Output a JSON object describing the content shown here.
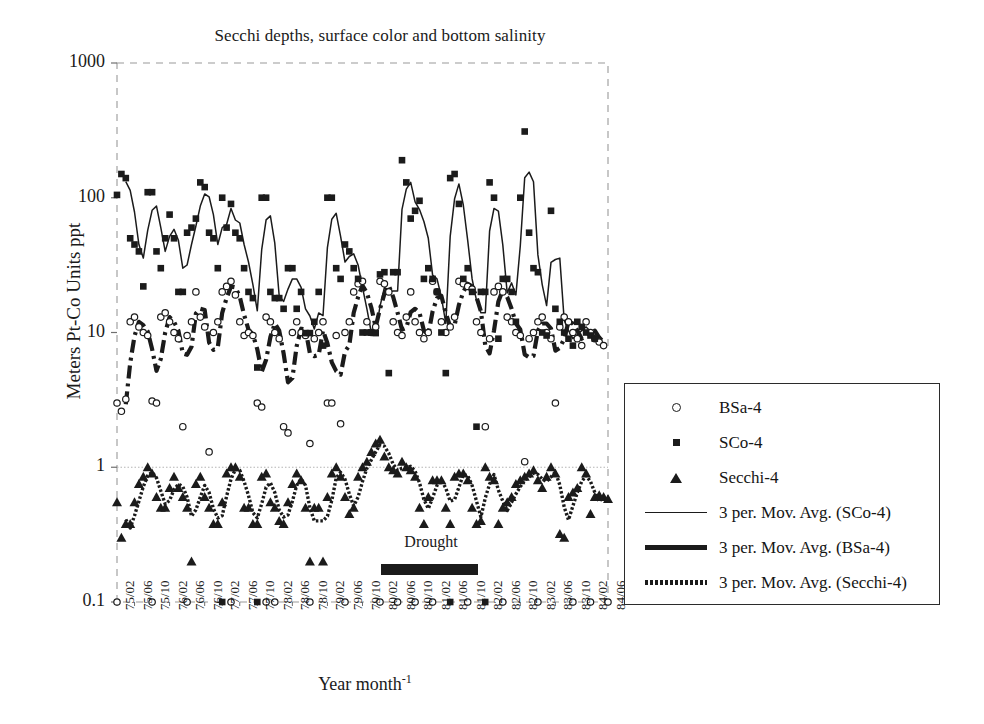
{
  "chart_data": {
    "type": "line",
    "title": "Secchi depths, surface color and bottom salinity",
    "xlabel": "Year month",
    "xlabel_exponent": "-1",
    "ylabel": "Meters Pt-Co Units ppt",
    "y_scale": "log",
    "ylim": [
      0.1,
      1000
    ],
    "ytick_labels": [
      "1000",
      "100",
      "10",
      "1",
      "0.1"
    ],
    "ytick_values": [
      1000,
      100,
      10,
      1,
      0.1
    ],
    "grid": "dashed-border-plus-dotted-line-at-1",
    "legend_position": "right-outside",
    "x_tick_labels": [
      "75/02",
      "75/06",
      "75/10",
      "76/02",
      "76/06",
      "76/10",
      "77/02",
      "77/06",
      "77/10",
      "78/02",
      "78/06",
      "78/10",
      "79/02",
      "79/06",
      "79/10",
      "80/02",
      "80/06",
      "80/10",
      "81/02",
      "81/06",
      "81/10",
      "82/02",
      "82/06",
      "82/10",
      "83/02",
      "83/06",
      "83/10",
      "84/02",
      "84/06"
    ],
    "x_tick_step_months": 4,
    "x_start": "75/02",
    "x_end": "84/06",
    "n_points": 113,
    "annotations": [
      {
        "text": "Drought",
        "type": "label-with-bar",
        "start": "80/10",
        "end": "81/10"
      }
    ],
    "series": [
      {
        "name": "BSa-4",
        "marker": "open-circle",
        "values": [
          3.0,
          2.6,
          3.2,
          12,
          13,
          11,
          10,
          9.5,
          3.1,
          3.0,
          13,
          14,
          12,
          10,
          9.0,
          2.0,
          9.5,
          12,
          20,
          13,
          11,
          1.3,
          10,
          12,
          20,
          22,
          24,
          19,
          12,
          9.5,
          10,
          9.5,
          3.0,
          2.8,
          13,
          12,
          10,
          9.0,
          2.0,
          1.8,
          10,
          12,
          10,
          9.5,
          1.5,
          9.0,
          10,
          12,
          3.0,
          3.0,
          9.5,
          2.1,
          10,
          12,
          20,
          23,
          24,
          12,
          10,
          11,
          24,
          23,
          20,
          12,
          10,
          9.5,
          13,
          20,
          12,
          10,
          9.0,
          10,
          24,
          20,
          12,
          10,
          11,
          13,
          24,
          23,
          22,
          21,
          12,
          10,
          2.0,
          9.0,
          20,
          22,
          20,
          13,
          12,
          10,
          9.5,
          1.1,
          9.0,
          10,
          12,
          13,
          10,
          9.0,
          3.0,
          11,
          13,
          12,
          10,
          9.0,
          8.0,
          12,
          10,
          9.0,
          8.5,
          8.0
        ]
      },
      {
        "name": "SCo-4",
        "marker": "filled-square",
        "values": [
          105,
          150,
          140,
          50,
          45,
          40,
          22,
          110,
          110,
          40,
          30,
          50,
          75,
          50,
          20,
          20,
          55,
          60,
          70,
          130,
          120,
          55,
          50,
          30,
          100,
          60,
          90,
          55,
          50,
          30,
          20,
          18,
          5.5,
          100,
          100,
          20,
          18,
          18,
          15,
          30,
          30,
          15,
          20,
          9.9,
          9.9,
          12,
          20,
          8.0,
          100,
          100,
          30,
          25,
          45,
          40,
          30,
          25,
          10,
          10,
          10,
          9.9,
          27,
          28,
          5.0,
          28,
          28,
          190,
          130,
          70,
          80,
          95,
          25,
          30,
          25,
          20,
          10,
          5.0,
          140,
          150,
          90,
          25,
          30,
          20,
          2.0,
          20,
          20,
          130,
          100,
          9.0,
          25,
          25,
          20,
          12,
          100,
          310,
          55,
          30,
          28,
          10,
          9.5,
          80,
          15,
          12,
          10,
          9.0,
          8.0,
          12,
          11,
          10,
          9.5,
          9.0
        ]
      },
      {
        "name": "Secchi-4",
        "marker": "filled-triangle",
        "values": [
          0.55,
          0.3,
          0.38,
          0.38,
          0.55,
          0.75,
          0.85,
          1.0,
          0.9,
          0.6,
          0.5,
          0.5,
          0.7,
          0.85,
          0.7,
          0.6,
          0.5,
          0.2,
          0.75,
          0.85,
          0.6,
          0.5,
          0.38,
          0.38,
          0.55,
          0.9,
          1.0,
          1.0,
          0.85,
          0.5,
          0.5,
          0.38,
          0.38,
          0.85,
          0.9,
          0.55,
          0.5,
          0.4,
          0.38,
          0.55,
          0.75,
          0.9,
          0.8,
          0.5,
          0.2,
          0.5,
          0.5,
          0.2,
          0.6,
          0.9,
          1.0,
          0.85,
          0.6,
          0.45,
          0.5,
          0.85,
          1.0,
          1.1,
          1.3,
          1.5,
          1.6,
          1.2,
          1.0,
          0.95,
          0.9,
          1.1,
          1.0,
          0.95,
          0.85,
          0.5,
          0.38,
          0.6,
          0.8,
          0.8,
          0.8,
          0.5,
          0.38,
          0.85,
          0.9,
          0.9,
          0.8,
          0.5,
          0.38,
          0.4,
          1.0,
          0.85,
          0.8,
          0.38,
          0.5,
          0.55,
          0.6,
          0.75,
          0.8,
          0.85,
          0.9,
          0.95,
          0.8,
          0.7,
          0.85,
          1.0,
          0.9,
          0.32,
          0.3,
          0.6,
          0.65,
          0.7,
          1.0,
          0.9,
          0.45,
          0.6,
          0.62,
          0.6,
          0.58
        ]
      }
    ],
    "moving_averages": [
      {
        "name": "3 per. Mov. Avg. (SCo-4)",
        "style": "thin-solid",
        "period": 3,
        "source": "SCo-4"
      },
      {
        "name": "3 per. Mov. Avg. (BSa-4)",
        "style": "thick-dash-dot",
        "period": 3,
        "source": "BSa-4"
      },
      {
        "name": "3 per. Mov. Avg. (Secchi-4)",
        "style": "dotted-thick",
        "period": 3,
        "source": "Secchi-4"
      }
    ],
    "baseline_points": {
      "value": 0.1,
      "note": "row of markers on the 0.1 axis line",
      "circles_at_index": [
        0,
        8,
        16,
        26,
        34,
        36,
        44,
        52,
        60,
        64,
        68,
        72,
        80,
        88,
        96,
        104,
        108,
        112
      ],
      "squares_at_index": [
        24,
        32,
        76,
        84
      ]
    }
  },
  "legend": {
    "items": [
      {
        "key": "open-circle",
        "label": "BSa-4"
      },
      {
        "key": "filled-square",
        "label": "SCo-4"
      },
      {
        "key": "filled-triangle",
        "label": "Secchi-4"
      },
      {
        "key": "thin-solid",
        "label": "3 per. Mov. Avg. (SCo-4)"
      },
      {
        "key": "thick-dash-dot",
        "label": "3 per. Mov. Avg. (BSa-4)"
      },
      {
        "key": "dotted-thick",
        "label": "3 per. Mov. Avg. (Secchi-4)"
      }
    ]
  },
  "annotation": {
    "drought_label": "Drought"
  },
  "colors": {
    "ink": "#1b1b1b",
    "border": "#9a9a9a",
    "background": "#ffffff"
  }
}
